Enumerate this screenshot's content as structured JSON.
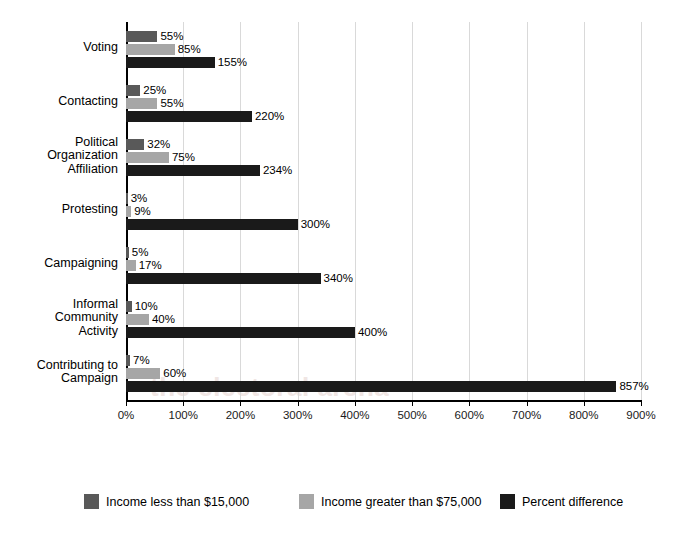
{
  "chart_data": {
    "type": "bar",
    "orientation": "horizontal",
    "title": "",
    "xlabel": "",
    "ylabel": "",
    "xlim": [
      0,
      900
    ],
    "xticks": [
      "0%",
      "100%",
      "200%",
      "300%",
      "400%",
      "500%",
      "600%",
      "700%",
      "800%",
      "900%"
    ],
    "xtick_values": [
      0,
      100,
      200,
      300,
      400,
      500,
      600,
      700,
      800,
      900
    ],
    "grid": true,
    "legend_position": "bottom",
    "categories": [
      "Voting",
      "Contacting",
      "Political\nOrganization\nAffiliation",
      "Protesting",
      "Campaigning",
      "Informal\nCommunity\nActivity",
      "Contributing to\nCampaign"
    ],
    "series": [
      {
        "name": "Income less than $15,000",
        "color": "#595959",
        "values": [
          55,
          25,
          32,
          3,
          5,
          10,
          7
        ],
        "labels": [
          "55%",
          "25%",
          "32%",
          "3%",
          "5%",
          "10%",
          "7%"
        ]
      },
      {
        "name": "Income greater than $75,000",
        "color": "#a6a6a6",
        "values": [
          85,
          55,
          75,
          9,
          17,
          40,
          60
        ],
        "labels": [
          "85%",
          "55%",
          "75%",
          "9%",
          "17%",
          "40%",
          "60%"
        ]
      },
      {
        "name": "Percent difference",
        "color": "#1a1a1a",
        "values": [
          155,
          220,
          234,
          300,
          340,
          400,
          857
        ],
        "labels": [
          "155%",
          "220%",
          "234%",
          "300%",
          "340%",
          "400%",
          "857%"
        ]
      }
    ]
  },
  "legend": {
    "items": [
      {
        "label": "Income less than $15,000",
        "color": "#595959"
      },
      {
        "label": "Income greater than $75,000",
        "color": "#a6a6a6"
      },
      {
        "label": "Percent difference",
        "color": "#1a1a1a"
      }
    ]
  },
  "watermark": {
    "text": "the electoral arena"
  }
}
